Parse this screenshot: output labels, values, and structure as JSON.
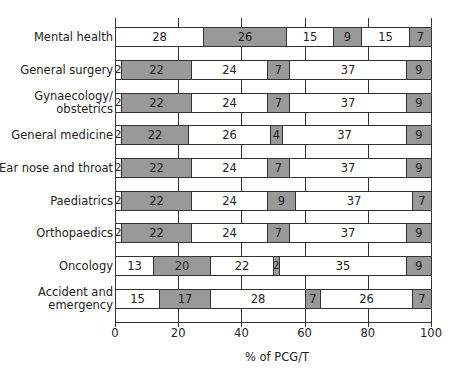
{
  "chart_data": {
    "type": "bar",
    "orientation": "horizontal",
    "stacked": true,
    "title": "",
    "xlabel": "% of PCG/T",
    "ylabel": "",
    "xlim": [
      0,
      100
    ],
    "xticks": [
      "0",
      "20",
      "40",
      "60",
      "80",
      "100"
    ],
    "grid": true,
    "legend": null,
    "segment_colors": [
      "#ffffff",
      "#999999",
      "#ffffff",
      "#999999",
      "#ffffff",
      "#999999"
    ],
    "categories": [
      "Mental health",
      "General surgery",
      "Gynaecology/ obstetrics",
      "General medicine",
      "Ear nose and throat",
      "Paediatrics",
      "Orthopaedics",
      "Oncology",
      "Accident and emergency"
    ],
    "rows": [
      {
        "label": [
          "Mental health"
        ],
        "values": [
          28,
          26,
          15,
          9,
          15,
          7
        ],
        "widths": [
          28,
          26,
          15,
          9,
          15,
          7
        ]
      },
      {
        "label": [
          "General surgery"
        ],
        "values": [
          2,
          22,
          24,
          7,
          37,
          9
        ],
        "widths": [
          2,
          22,
          24,
          7,
          37,
          8
        ]
      },
      {
        "label": [
          "Gynaecology/",
          "obstetrics"
        ],
        "values": [
          2,
          22,
          24,
          7,
          37,
          9
        ],
        "widths": [
          2,
          22,
          24,
          7,
          37,
          8
        ]
      },
      {
        "label": [
          "General medicine"
        ],
        "values": [
          2,
          22,
          26,
          4,
          37,
          9
        ],
        "widths": [
          2,
          21,
          26,
          4,
          39,
          8
        ]
      },
      {
        "label": [
          "Ear nose and throat"
        ],
        "values": [
          2,
          22,
          24,
          7,
          37,
          9
        ],
        "widths": [
          2,
          22,
          24,
          7,
          37,
          8
        ]
      },
      {
        "label": [
          "Paediatrics"
        ],
        "values": [
          2,
          22,
          24,
          9,
          37,
          7
        ],
        "widths": [
          2,
          22,
          24,
          9,
          37,
          6
        ]
      },
      {
        "label": [
          "Orthopaedics"
        ],
        "values": [
          2,
          22,
          24,
          7,
          37,
          9
        ],
        "widths": [
          2,
          22,
          24,
          7,
          37,
          8
        ]
      },
      {
        "label": [
          "Oncology"
        ],
        "values": [
          13,
          20,
          22,
          2,
          35,
          9
        ],
        "widths": [
          12,
          18,
          20,
          2,
          40,
          8
        ]
      },
      {
        "label": [
          "Accident and",
          "emergency"
        ],
        "values": [
          15,
          17,
          28,
          7,
          26,
          7
        ],
        "widths": [
          14,
          16,
          30,
          5,
          29,
          6
        ]
      }
    ]
  }
}
